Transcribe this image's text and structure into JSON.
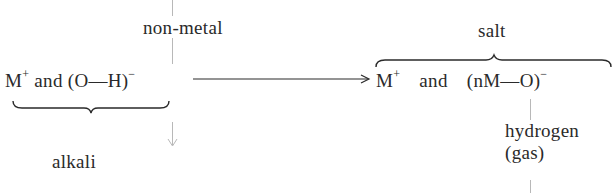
{
  "diagram": {
    "type": "chemical-reaction-scheme",
    "nodes": {
      "reactant": {
        "metal_ion": "M",
        "metal_charge": "+",
        "conjunction": "and",
        "anion": "(O—H)",
        "anion_charge": "−",
        "group_label": "alkali"
      },
      "reagent": {
        "label": "non-metal"
      },
      "product": {
        "metal_ion": "M",
        "metal_charge": "+",
        "conjunction": "and",
        "anion": "(nM—O)",
        "anion_charge": "−",
        "group_label": "salt"
      },
      "byproduct": {
        "line1": "hydrogen",
        "line2": "(gas)"
      }
    },
    "edges": [
      {
        "from": "reactant",
        "to": "product",
        "style": "solid-arrow"
      },
      {
        "from": "reagent",
        "to": "reactant",
        "style": "gray-vertical-line-with-arrow"
      },
      {
        "from": "product",
        "to": "byproduct",
        "style": "gray-vertical-line"
      }
    ],
    "colors": {
      "text": "#2a2a2a",
      "arrow": "#2a2a2a",
      "guide_lines": "#b8b8b8"
    }
  }
}
